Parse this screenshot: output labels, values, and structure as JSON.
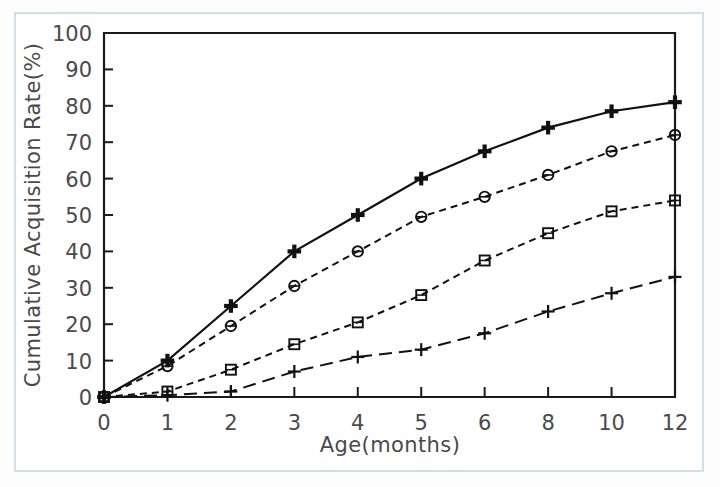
{
  "figure": {
    "background_color": "#ffffff",
    "frame_color": "#cfe0ea",
    "axis_color": "#1a1a1a",
    "text_color": "#4a4a4a"
  },
  "chart_data": {
    "type": "line",
    "title": "",
    "xlabel": "Age(months)",
    "ylabel": "Cumulative Acquisition Rate(%)",
    "x": [
      0,
      1,
      2,
      3,
      4,
      5,
      6,
      8,
      10,
      12
    ],
    "x_tick_labels": [
      "0",
      "1",
      "2",
      "3",
      "4",
      "5",
      "6",
      "8",
      "10",
      "12"
    ],
    "x_scale": "categorical",
    "y_tick_labels": [
      "0",
      "10",
      "20",
      "30",
      "40",
      "50",
      "60",
      "70",
      "80",
      "90",
      "100"
    ],
    "y_ticks": [
      0,
      10,
      20,
      30,
      40,
      50,
      60,
      70,
      80,
      90,
      100
    ],
    "ylim": [
      0,
      100
    ],
    "grid": false,
    "legend": "none",
    "series": [
      {
        "name": "series-1",
        "marker": "filled-plus",
        "line_style": "solid",
        "values": [
          0,
          10,
          25,
          40,
          50,
          60,
          67.5,
          74,
          78.5,
          81
        ]
      },
      {
        "name": "series-2",
        "marker": "open-circle",
        "line_style": "dashed",
        "values": [
          0,
          8.5,
          19.5,
          30.5,
          40,
          49.5,
          55,
          61,
          67.5,
          72
        ]
      },
      {
        "name": "series-3",
        "marker": "open-square",
        "line_style": "dashed",
        "values": [
          0,
          1.5,
          7.5,
          14.5,
          20.5,
          28,
          37.5,
          45,
          51,
          54
        ]
      },
      {
        "name": "series-4",
        "marker": "plus",
        "line_style": "long-dash",
        "values": [
          0,
          0.5,
          1.5,
          7,
          11,
          13,
          17.5,
          23.5,
          28.5,
          33
        ]
      }
    ]
  }
}
